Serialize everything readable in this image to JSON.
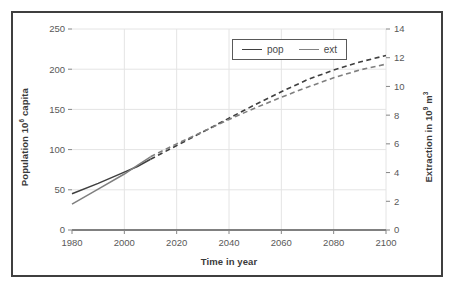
{
  "chart_data": {
    "type": "line",
    "title": "",
    "xlabel": "Time in year",
    "ylabel": "Population 10⁶ capita",
    "ylabel_right": "Extraction in 10⁹ m³",
    "xlim": [
      1980,
      2100
    ],
    "ylim": [
      0,
      250
    ],
    "ylim_right": [
      0,
      14
    ],
    "xticks": [
      1980,
      2000,
      2020,
      2040,
      2060,
      2080,
      2100
    ],
    "yticks": [
      0,
      50,
      100,
      150,
      200,
      250
    ],
    "yticks_right": [
      0,
      2,
      4,
      6,
      8,
      10,
      12,
      14
    ],
    "grid": true,
    "legend_position": "top-center",
    "legend": [
      "pop",
      "ext"
    ],
    "solid_until": 2010,
    "series": [
      {
        "name": "pop",
        "axis": "left",
        "color": "#3f3f3f",
        "x": [
          1980,
          1990,
          2000,
          2005,
          2010,
          2020,
          2030,
          2040,
          2050,
          2060,
          2070,
          2080,
          2090,
          2100
        ],
        "values": [
          45,
          58,
          72,
          79,
          88,
          105,
          122,
          139,
          156,
          172,
          187,
          199,
          209,
          217
        ]
      },
      {
        "name": "ext",
        "axis": "right",
        "color": "#7f7f7f",
        "x": [
          1980,
          1990,
          2000,
          2005,
          2010,
          2020,
          2030,
          2040,
          2050,
          2060,
          2070,
          2080,
          2090,
          2100
        ],
        "values": [
          1.8,
          2.85,
          3.9,
          4.5,
          5.1,
          6.0,
          6.85,
          7.7,
          8.5,
          9.25,
          9.95,
          10.6,
          11.15,
          11.55
        ]
      }
    ]
  },
  "axes": {
    "x_title": "Time in year",
    "y_left_title_main": "Population 10",
    "y_left_title_sup": "6",
    "y_left_title_tail": " capita",
    "y_right_title_main": "Extraction in 10",
    "y_right_title_sup": "9",
    "y_right_title_tail": " m",
    "y_right_title_sup2": "3"
  },
  "legend": {
    "pop_label": "pop",
    "ext_label": "ext",
    "pop_color": "#3f3f3f",
    "ext_color": "#808080"
  },
  "colors": {
    "frame": "#3f3f3f",
    "grid": "#e4e4e4",
    "axis_line": "#868686",
    "tick_text": "#595959",
    "background": "#ffffff"
  }
}
